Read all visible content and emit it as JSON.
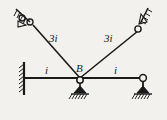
{
  "diagram": {
    "type": "structural-frame-stiffness-diagram",
    "background_color": "#f2f1ee",
    "line_color": "#1a1a1a",
    "labels": {
      "joint_b": "B",
      "member_left_diagonal": "3i",
      "member_right_diagonal": "3i",
      "beam_left_segment": "i",
      "beam_right_segment": "i"
    },
    "nodes": {
      "top_left_support": {
        "x": 31,
        "y": 23,
        "name": "pin-support-top-left"
      },
      "top_right_support": {
        "x": 139,
        "y": 30,
        "name": "pin-support-top-right"
      },
      "joint_b": {
        "x": 80,
        "y": 78,
        "name": "hinge-joint-b"
      },
      "beam_left_end": {
        "x": 24,
        "y": 78,
        "name": "fixed-wall-left"
      },
      "beam_right_end": {
        "x": 143,
        "y": 78,
        "name": "hinge-right-end"
      },
      "support_b_ground": {
        "x": 80,
        "y": 91,
        "name": "pin-support-b"
      },
      "support_right_ground": {
        "x": 143,
        "y": 91,
        "name": "pin-support-right"
      }
    },
    "members": [
      {
        "name": "left-diagonal",
        "from": "top_left_support",
        "to": "joint_b",
        "stiffness": "3i"
      },
      {
        "name": "right-diagonal",
        "from": "top_right_support",
        "to": "joint_b",
        "stiffness": "3i"
      },
      {
        "name": "beam-left",
        "from": "beam_left_end",
        "to": "joint_b",
        "stiffness": "i"
      },
      {
        "name": "beam-right",
        "from": "joint_b",
        "to": "beam_right_end",
        "stiffness": "i"
      }
    ],
    "supports": [
      {
        "name": "fixed-wall-left",
        "kind": "fixed"
      },
      {
        "name": "pin-support-top-left",
        "kind": "pin-inclined"
      },
      {
        "name": "pin-support-top-right",
        "kind": "pin-inclined"
      },
      {
        "name": "pin-support-b",
        "kind": "pin"
      },
      {
        "name": "pin-support-right",
        "kind": "pin"
      }
    ]
  }
}
